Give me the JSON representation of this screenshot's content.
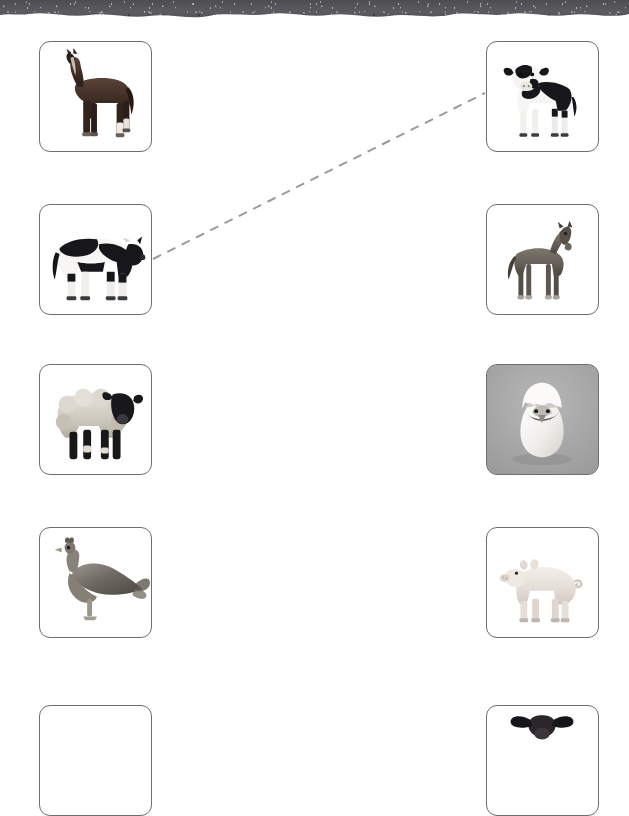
{
  "worksheet": {
    "title": "Animal and Baby Animal Matching Worksheet",
    "header_band_color": "#545458",
    "card_border_color": "#6e6e72",
    "connector_color": "#9a9aa0",
    "layout": {
      "columns": 2,
      "rows": 5,
      "left_column_label": "Adult Animals",
      "right_column_label": "Baby Animals"
    }
  },
  "left_column": {
    "name": "adult-animals-column",
    "items": [
      {
        "id": "horse",
        "label": "Horse",
        "alt": "Dark brown adult horse standing, facing left",
        "background": "white",
        "row": 1
      },
      {
        "id": "cow",
        "label": "Cow",
        "alt": "Black and white Holstein cow standing, facing right",
        "background": "white",
        "row": 2
      },
      {
        "id": "sheep",
        "label": "Sheep",
        "alt": "Suffolk sheep with black face and legs, facing right",
        "background": "white",
        "row": 3
      },
      {
        "id": "chicken",
        "label": "Chicken",
        "alt": "Speckled grey hen standing, facing left",
        "background": "white",
        "row": 4
      },
      {
        "id": "goat",
        "label": "Goat",
        "alt": "Animal photo cut off at bottom edge of page",
        "background": "white",
        "row": 5
      }
    ]
  },
  "right_column": {
    "name": "baby-animals-column",
    "items": [
      {
        "id": "calf",
        "label": "Calf",
        "alt": "Black and white calf standing facing forward",
        "background": "white",
        "row": 1
      },
      {
        "id": "foal",
        "label": "Foal",
        "alt": "Young grey-brown foal standing, facing right",
        "background": "white",
        "row": 2
      },
      {
        "id": "chick",
        "label": "Chick",
        "alt": "Chick hatching out of a white egg shell",
        "background": "gray",
        "row": 3
      },
      {
        "id": "piglet",
        "label": "Piglet",
        "alt": "Pale pink piglet standing, facing left",
        "background": "white",
        "row": 4
      },
      {
        "id": "lamb",
        "label": "Lamb",
        "alt": "Lamb head with black ears, photo cut off at bottom edge",
        "background": "white",
        "row": 5
      }
    ]
  },
  "connections": [
    {
      "id": "cow-to-calf",
      "from": "cow",
      "to": "calf",
      "style": "dashed",
      "color": "#9a9aa0",
      "x1": 153,
      "y1": 259,
      "x2": 485,
      "y2": 93
    }
  ]
}
